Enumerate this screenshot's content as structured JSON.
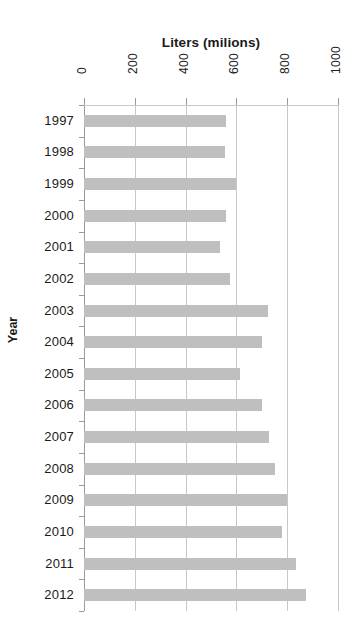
{
  "chart_data": {
    "type": "bar",
    "orientation": "horizontal",
    "title": "Liters (milions)",
    "xlabel": "Liters (milions)",
    "ylabel": "Year",
    "xlim": [
      0,
      1000
    ],
    "xticks": [
      0,
      200,
      400,
      600,
      800,
      1000
    ],
    "xtick_labels": [
      "0",
      "200",
      "400",
      "600",
      "800",
      "1000"
    ],
    "grid": true,
    "legend": "none",
    "bar_color": "#bfbfbf",
    "axis_color": "#9a9a9a",
    "gridline_color": "#c8c8c8",
    "categories": [
      "1997",
      "1998",
      "1999",
      "2000",
      "2001",
      "2002",
      "2003",
      "2004",
      "2005",
      "2006",
      "2007",
      "2008",
      "2009",
      "2010",
      "2011",
      "2012"
    ],
    "values": [
      559,
      556,
      600,
      560,
      535,
      576,
      724,
      700,
      614,
      700,
      728,
      750,
      800,
      780,
      835,
      874
    ],
    "series": [
      {
        "name": "Liters (milions)",
        "values": [
          559,
          556,
          600,
          560,
          535,
          576,
          724,
          700,
          614,
          700,
          728,
          750,
          800,
          780,
          835,
          874
        ]
      }
    ]
  }
}
